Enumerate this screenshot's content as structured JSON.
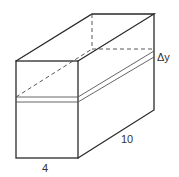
{
  "diagram": {
    "type": "3d-rectangular-box-with-horizontal-slice",
    "labels": {
      "width": "4",
      "length": "10",
      "slice_thickness": "Δy"
    },
    "colors": {
      "line": "#2a2a2a",
      "background": "#ffffff"
    }
  }
}
